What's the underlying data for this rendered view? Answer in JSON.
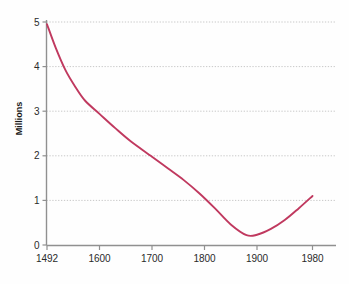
{
  "chart_data": {
    "type": "line",
    "title": "",
    "xlabel": "",
    "ylabel": "Millions",
    "grid": true,
    "legend": false,
    "legend_position": "none",
    "line_color": "#c0395f",
    "axis_color": "#808080",
    "grid_color": "#c8c8c8",
    "background_color": "#fefefe",
    "xlim": [
      1492,
      1980
    ],
    "ylim": [
      0,
      5
    ],
    "x_ticks": [
      1492,
      1600,
      1700,
      1800,
      1900,
      1980
    ],
    "x_tick_labels": [
      "1492",
      "1600",
      "1700",
      "1800",
      "1900",
      "1980"
    ],
    "y_ticks": [
      0,
      1,
      2,
      3,
      4,
      5
    ],
    "y_tick_labels": [
      "0",
      "1",
      "2",
      "3",
      "4",
      "5"
    ],
    "series": [
      {
        "name": "Population",
        "x": [
          1492,
          1510,
          1530,
          1550,
          1570,
          1600,
          1630,
          1660,
          1700,
          1730,
          1760,
          1790,
          1820,
          1850,
          1880,
          1900,
          1920,
          1940,
          1960,
          1980
        ],
        "values": [
          4.95,
          4.42,
          3.92,
          3.55,
          3.24,
          2.94,
          2.62,
          2.32,
          1.98,
          1.72,
          1.46,
          1.16,
          0.82,
          0.46,
          0.22,
          0.23,
          0.36,
          0.56,
          0.82,
          1.1
        ]
      }
    ]
  }
}
